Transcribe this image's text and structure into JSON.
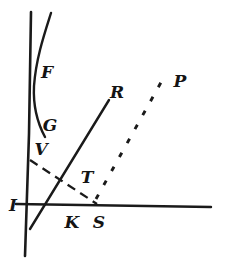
{
  "figure": {
    "name": "geometric-line-diagram",
    "background_color": "#ffffff",
    "ink_color": "#1a1a1a",
    "width": 227,
    "height": 260
  },
  "labels": {
    "f": "F",
    "g": "G",
    "v": "V",
    "i": "I",
    "k": "K",
    "s": "S",
    "t": "T",
    "r": "R",
    "p": "P"
  },
  "label_positions": {
    "f": {
      "x": 47,
      "y": 78
    },
    "g": {
      "x": 50,
      "y": 131
    },
    "v": {
      "x": 41,
      "y": 155
    },
    "i": {
      "x": 13,
      "y": 211
    },
    "k": {
      "x": 72,
      "y": 228
    },
    "s": {
      "x": 99,
      "y": 228
    },
    "t": {
      "x": 87,
      "y": 183
    },
    "r": {
      "x": 117,
      "y": 98
    },
    "p": {
      "x": 180,
      "y": 87
    }
  },
  "chart_data": {
    "type": "line",
    "title": "",
    "xlabel": "",
    "ylabel": "",
    "grid": false,
    "legend": "none",
    "axes": {
      "vertical_axis": {
        "x1": 31,
        "y1": 12,
        "x2": 25,
        "y2": 256
      },
      "horizontal_axis": {
        "x1": 16,
        "y1": 204,
        "x2": 211,
        "y2": 207
      }
    },
    "series": [
      {
        "name": "F-G-V curve",
        "label": "F",
        "style": "solid",
        "points": [
          {
            "x": 51,
            "y": 13
          },
          {
            "x": 44,
            "y": 34
          },
          {
            "x": 37,
            "y": 60
          },
          {
            "x": 34,
            "y": 84
          },
          {
            "x": 35,
            "y": 103
          },
          {
            "x": 39,
            "y": 121
          },
          {
            "x": 44,
            "y": 136
          }
        ]
      },
      {
        "name": "R line",
        "label": "R",
        "style": "solid",
        "points": [
          {
            "x": 30,
            "y": 229
          },
          {
            "x": 109,
            "y": 100
          }
        ]
      },
      {
        "name": "V-T-S dashed line",
        "label": "T",
        "style": "dashed",
        "points": [
          {
            "x": 30,
            "y": 160
          },
          {
            "x": 97,
            "y": 204
          }
        ]
      },
      {
        "name": "S-P dotted line",
        "label": "P",
        "style": "dotted",
        "points": [
          {
            "x": 96,
            "y": 199
          },
          {
            "x": 164,
            "y": 77
          }
        ]
      }
    ],
    "annotations": [
      {
        "text": "F",
        "x": 47,
        "y": 78,
        "note": "upper curve branch"
      },
      {
        "text": "G",
        "x": 50,
        "y": 131,
        "note": "lower curve branch"
      },
      {
        "text": "V",
        "x": 41,
        "y": 155,
        "note": "curve endpoint near axis"
      },
      {
        "text": "I",
        "x": 13,
        "y": 211,
        "note": "origin on vertical axis"
      },
      {
        "text": "K",
        "x": 72,
        "y": 228,
        "note": "R line crosses horizontal axis"
      },
      {
        "text": "S",
        "x": 99,
        "y": 228,
        "note": "dashed and dotted meet axis"
      },
      {
        "text": "T",
        "x": 87,
        "y": 183,
        "note": "dashed crosses R line"
      },
      {
        "text": "R",
        "x": 117,
        "y": 98,
        "note": "top of R line"
      },
      {
        "text": "P",
        "x": 180,
        "y": 87,
        "note": "top of dotted line"
      }
    ]
  }
}
